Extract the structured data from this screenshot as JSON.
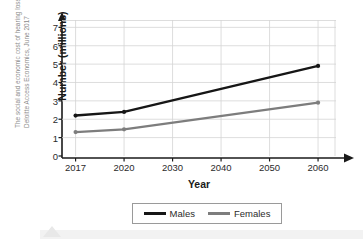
{
  "source_caption": {
    "line1": "The social and economic cost of hearing loss in Australia,",
    "line2": "Deloitte Access Economics, June 2017"
  },
  "legend": {
    "items": [
      {
        "label": "Males",
        "color": "#161616"
      },
      {
        "label": "Females",
        "color": "#7d7d7d"
      }
    ]
  },
  "axes": {
    "x_title": "Year",
    "y_title": "Number (millions)",
    "y_ticks": [
      "0",
      "1",
      "2",
      "3",
      "4",
      "5",
      "6",
      "7"
    ],
    "x_ticks": [
      "2017",
      "2020",
      "2030",
      "2040",
      "2050",
      "2060"
    ]
  },
  "chart_data": {
    "type": "line",
    "title": "",
    "xlabel": "Year",
    "ylabel": "Number (millions)",
    "x": [
      2017,
      2020,
      2030,
      2040,
      2050,
      2060
    ],
    "xtick_labels": [
      "2017",
      "2020",
      "2030",
      "2040",
      "2050",
      "2060"
    ],
    "ytick_labels": [
      "0",
      "1",
      "2",
      "3",
      "4",
      "5",
      "6",
      "7"
    ],
    "ylim": [
      0,
      7.4
    ],
    "grid": true,
    "legend_position": "bottom",
    "marker_years": [
      2017,
      2020,
      2060
    ],
    "series": [
      {
        "name": "Males",
        "color": "#161616",
        "points": [
          {
            "year": 2017,
            "value": 2.2
          },
          {
            "year": 2020,
            "value": 2.4
          },
          {
            "year": 2060,
            "value": 4.9
          }
        ]
      },
      {
        "name": "Females",
        "color": "#7d7d7d",
        "points": [
          {
            "year": 2017,
            "value": 1.3
          },
          {
            "year": 2020,
            "value": 1.45
          },
          {
            "year": 2060,
            "value": 2.9
          }
        ]
      }
    ]
  }
}
